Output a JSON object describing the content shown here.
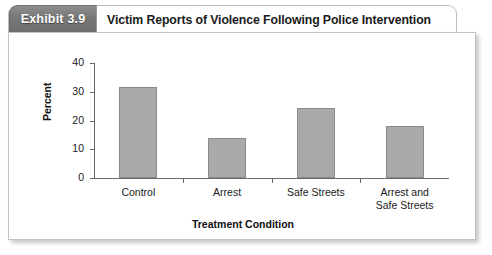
{
  "exhibit": {
    "badge_label": "Exhibit 3.9",
    "title": "Victim Reports of Violence Following Police Intervention"
  },
  "chart_data": {
    "type": "bar",
    "title": "Victim Reports of Violence Following Police Intervention",
    "categories": [
      "Control",
      "Arrest",
      "Safe Streets",
      "Arrest and\nSafe Streets"
    ],
    "values": [
      31.5,
      14,
      24.5,
      18
    ],
    "xlabel": "Treatment Condition",
    "ylabel": "Percent",
    "ylim": [
      0,
      40
    ],
    "yticks": [
      0,
      10,
      20,
      30,
      40
    ],
    "ytick_labels": [
      "0",
      "10",
      "20",
      "30",
      "40"
    ],
    "grid": false,
    "legend": false,
    "bar_color": "#a9a9a9",
    "bar_edge_color": "#8a8a8a",
    "axis_color": "#6a6a6a"
  }
}
